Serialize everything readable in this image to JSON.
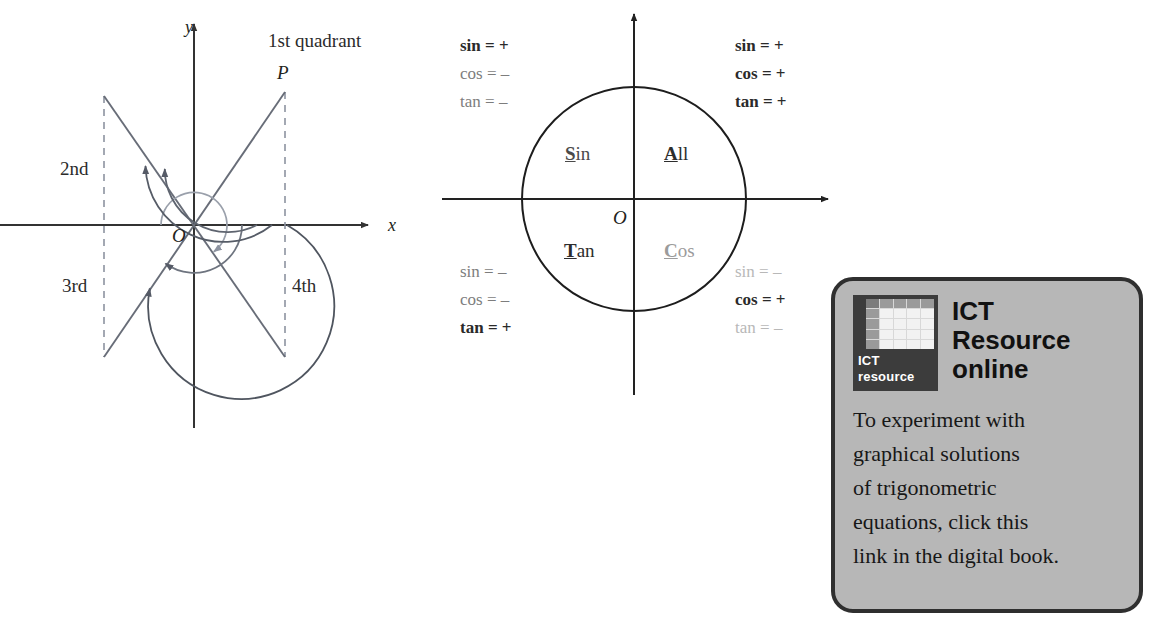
{
  "figure_quadrants": {
    "name": "quadrant-angles-diagram",
    "axis_x_label": "x",
    "axis_y_label": "y",
    "origin_label": "O",
    "point_label": "P",
    "quadrant_labels": {
      "first": "1st quadrant",
      "second": "2nd",
      "third": "3rd",
      "fourth": "4th"
    }
  },
  "figure_cast": {
    "name": "cast-unit-circle-diagram",
    "origin_label": "O",
    "quadrant_words": [
      {
        "initial": "A",
        "rest": "ll",
        "tone": "dark",
        "quadrant": "first"
      },
      {
        "initial": "S",
        "rest": "in",
        "tone": "mid",
        "quadrant": "second"
      },
      {
        "initial": "T",
        "rest": "an",
        "tone": "dark",
        "quadrant": "third"
      },
      {
        "initial": "C",
        "rest": "os",
        "tone": "light",
        "quadrant": "fourth"
      }
    ],
    "sign_groups": [
      {
        "quadrant": "second",
        "position": "top-left",
        "rows": [
          {
            "fn": "sin",
            "sign": "+",
            "emphasis": "bold"
          },
          {
            "fn": "cos",
            "sign": "–",
            "emphasis": "normal"
          },
          {
            "fn": "tan",
            "sign": "–",
            "emphasis": "normal"
          }
        ]
      },
      {
        "quadrant": "first",
        "position": "top-right",
        "rows": [
          {
            "fn": "sin",
            "sign": "+",
            "emphasis": "bold"
          },
          {
            "fn": "cos",
            "sign": "+",
            "emphasis": "bold"
          },
          {
            "fn": "tan",
            "sign": "+",
            "emphasis": "bold"
          }
        ]
      },
      {
        "quadrant": "third",
        "position": "bottom-left",
        "rows": [
          {
            "fn": "sin",
            "sign": "–",
            "emphasis": "normal"
          },
          {
            "fn": "cos",
            "sign": "–",
            "emphasis": "normal"
          },
          {
            "fn": "tan",
            "sign": "+",
            "emphasis": "bold"
          }
        ]
      },
      {
        "quadrant": "fourth",
        "position": "bottom-right",
        "rows": [
          {
            "fn": "sin",
            "sign": "–",
            "emphasis": "faint"
          },
          {
            "fn": "cos",
            "sign": "+",
            "emphasis": "bold"
          },
          {
            "fn": "tan",
            "sign": "–",
            "emphasis": "faint"
          }
        ]
      }
    ]
  },
  "ict_box": {
    "icon_caption_line1": "ICT",
    "icon_caption_line2": "resource",
    "title_line1": "ICT",
    "title_line2": "Resource",
    "title_line3": "online",
    "body_lines": [
      "To experiment with",
      "graphical solutions",
      "of trigonometric",
      "equations, click this",
      "link in the digital book."
    ],
    "border_color": "#2f2f2f",
    "fill_color": "#b7b7b7"
  }
}
